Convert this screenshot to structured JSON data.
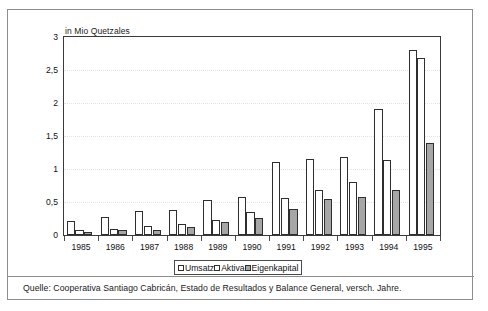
{
  "figure": {
    "axis_title": "in Mio Quetzales",
    "caption": "Quelle: Cooperativa Santiago Cabricán, Estado de Resultados y Balance General, versch. Jahre."
  },
  "legend": {
    "items": [
      {
        "label": "Umsatz",
        "swatch": "white"
      },
      {
        "label": "Aktiva",
        "swatch": "white"
      },
      {
        "label": "Eigenkapital",
        "swatch": "gray"
      }
    ]
  },
  "chart_data": {
    "type": "bar",
    "title": "",
    "subtitle": "",
    "xlabel": "",
    "ylabel": "in Mio Quetzales",
    "ylim": [
      0,
      3
    ],
    "ytick_values": [
      0,
      0.5,
      1,
      1.5,
      2,
      2.5,
      3
    ],
    "ytick_labels": [
      "0",
      "0,5",
      "1",
      "1,5",
      "2",
      "2,5",
      "3"
    ],
    "grid": true,
    "grid_style": "dotted",
    "legend_position": "bottom-center",
    "categories": [
      "1985",
      "1986",
      "1987",
      "1988",
      "1989",
      "1990",
      "1991",
      "1992",
      "1993",
      "1994",
      "1995"
    ],
    "series": [
      {
        "name": "Umsatz",
        "color": "#ffffff",
        "edge_color": "#2e2e2e",
        "values": [
          0.21,
          0.28,
          0.36,
          0.38,
          0.53,
          0.57,
          1.11,
          1.15,
          1.18,
          1.91,
          2.8
        ]
      },
      {
        "name": "Aktiva",
        "color": "#ffffff",
        "edge_color": "#2e2e2e",
        "values": [
          0.07,
          0.09,
          0.13,
          0.16,
          0.23,
          0.35,
          0.56,
          0.68,
          0.8,
          1.14,
          2.68
        ]
      },
      {
        "name": "Eigenkapital",
        "color": "#a6a6a6",
        "edge_color": "#2e2e2e",
        "values": [
          0.05,
          0.07,
          0.08,
          0.12,
          0.2,
          0.26,
          0.39,
          0.55,
          0.57,
          0.68,
          1.4
        ]
      }
    ]
  }
}
